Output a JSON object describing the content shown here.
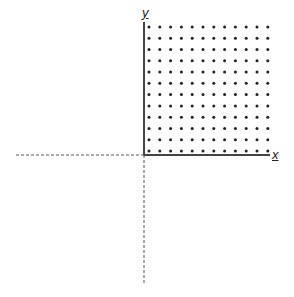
{
  "diagram": {
    "title": "",
    "x_axis_label": "x",
    "y_axis_label": "y",
    "grid": {
      "rows": 12,
      "cols": 12,
      "first_x": 149,
      "first_y": 27,
      "dx": 10.8,
      "dy": 11.27,
      "dot_radius": 1.5,
      "color": "#222222"
    },
    "origin": {
      "x": 144,
      "y": 155
    },
    "axis_color": "#444444"
  }
}
